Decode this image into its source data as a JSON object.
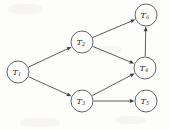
{
  "figure": {
    "background_color": "#fdfdfc",
    "line_color": "#3f3f3f",
    "node_fill": "#fdfdfc",
    "label_color": "#303030",
    "width": 170,
    "height": 130
  },
  "chart_data": {
    "type": "diagram",
    "subtype": "directed-acyclic-graph",
    "title": "",
    "xlabel": "",
    "ylabel": "",
    "grid": false,
    "legend": "none",
    "node_radius": 11,
    "nodes": [
      {
        "id": "T1",
        "base": "T",
        "sub": "1",
        "label": "T1",
        "x": 18,
        "y": 72
      },
      {
        "id": "T2",
        "base": "T",
        "sub": "2",
        "label": "T2",
        "x": 82,
        "y": 42
      },
      {
        "id": "T3",
        "base": "T",
        "sub": "3",
        "label": "T3",
        "x": 82,
        "y": 101
      },
      {
        "id": "T4",
        "base": "T",
        "sub": "4",
        "label": "T4",
        "x": 145,
        "y": 68
      },
      {
        "id": "T5",
        "base": "T",
        "sub": "5",
        "label": "T5",
        "x": 146,
        "y": 101
      },
      {
        "id": "T6",
        "base": "T",
        "sub": "6",
        "label": "T6",
        "x": 146,
        "y": 15
      }
    ],
    "edges": [
      {
        "from": "T1",
        "to": "T2",
        "directed": true
      },
      {
        "from": "T1",
        "to": "T3",
        "directed": true
      },
      {
        "from": "T2",
        "to": "T6",
        "directed": true
      },
      {
        "from": "T2",
        "to": "T4",
        "directed": true
      },
      {
        "from": "T3",
        "to": "T4",
        "directed": true
      },
      {
        "from": "T3",
        "to": "T5",
        "directed": true
      },
      {
        "from": "T4",
        "to": "T6",
        "directed": true
      }
    ]
  }
}
